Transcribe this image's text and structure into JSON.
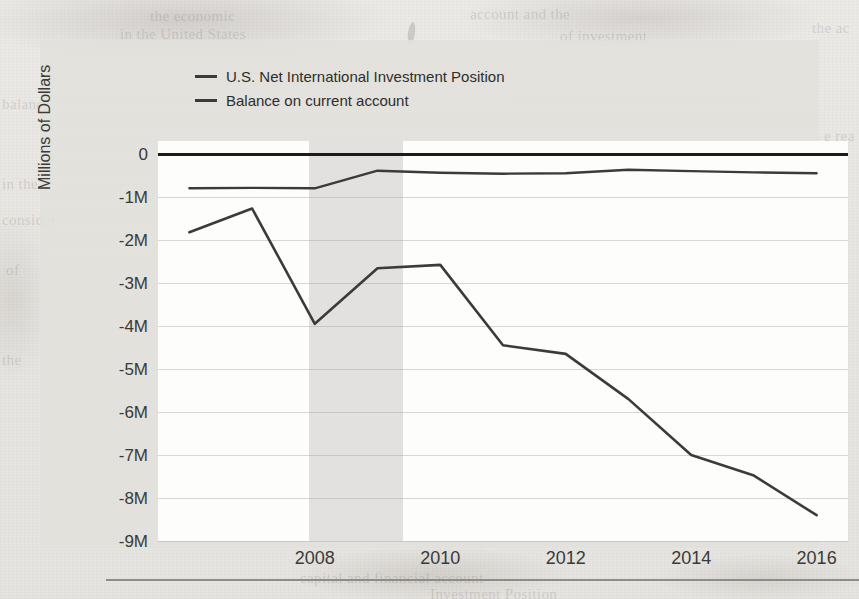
{
  "figure": {
    "kind": "scanned-book-figure",
    "y_axis_title": "Millions of Dollars",
    "legend": [
      {
        "label": "U.S. Net International Investment Position",
        "color": "#3b3b3b"
      },
      {
        "label": "Balance on current account",
        "color": "#3b3b3b"
      }
    ],
    "y_ticks": [
      "0",
      "-1M",
      "-2M",
      "-3M",
      "-4M",
      "-5M",
      "-6M",
      "-7M",
      "-8M",
      "-9M"
    ],
    "x_ticks": [
      "2008",
      "2010",
      "2012",
      "2014",
      "2016"
    ]
  },
  "page_ghost_text": [
    {
      "text": "the economic",
      "x": 150,
      "y": 8
    },
    {
      "text": "account and the",
      "x": 470,
      "y": 6
    },
    {
      "text": "in the United States",
      "x": 120,
      "y": 26
    },
    {
      "text": "of investment",
      "x": 560,
      "y": 28
    },
    {
      "text": "the ac",
      "x": 812,
      "y": 20
    },
    {
      "text": "balance",
      "x": 2,
      "y": 96
    },
    {
      "text": "in the",
      "x": 2,
      "y": 176
    },
    {
      "text": "consider",
      "x": 2,
      "y": 212
    },
    {
      "text": "of",
      "x": 6,
      "y": 262
    },
    {
      "text": "the",
      "x": 2,
      "y": 352
    },
    {
      "text": "e rea",
      "x": 824,
      "y": 128
    },
    {
      "text": "on",
      "x": 830,
      "y": 228
    },
    {
      "text": "cur",
      "x": 826,
      "y": 404
    },
    {
      "text": "an",
      "x": 832,
      "y": 452
    },
    {
      "text": "capital and financial account",
      "x": 300,
      "y": 570
    },
    {
      "text": "Investment Position",
      "x": 430,
      "y": 586
    }
  ],
  "chart_data": {
    "type": "line",
    "title": "",
    "xlabel": "",
    "ylabel": "Millions of Dollars",
    "xlim": [
      2005.5,
      2016.5
    ],
    "ylim": [
      -9000000,
      300000
    ],
    "y_tick_values": [
      0,
      -1000000,
      -2000000,
      -3000000,
      -4000000,
      -5000000,
      -6000000,
      -7000000,
      -8000000,
      -9000000
    ],
    "y_tick_labels": [
      "0",
      "-1M",
      "-2M",
      "-3M",
      "-4M",
      "-5M",
      "-6M",
      "-7M",
      "-8M",
      "-9M"
    ],
    "x_tick_values": [
      2008,
      2010,
      2012,
      2014,
      2016
    ],
    "x_tick_labels": [
      "2008",
      "2010",
      "2012",
      "2014",
      "2016"
    ],
    "grid": true,
    "legend_position": "top-left",
    "units": "Millions of Dollars",
    "zero_reference_line": 0,
    "shaded_regions": [
      {
        "label": "recession",
        "x_start": 2007.9,
        "x_end": 2009.4,
        "color": "#e2e1df"
      }
    ],
    "x": [
      2006,
      2007,
      2008,
      2009,
      2010,
      2011,
      2012,
      2013,
      2014,
      2015,
      2016
    ],
    "series": [
      {
        "name": "U.S. Net International Investment Position",
        "color": "#3b3b3b",
        "values": [
          -1820000,
          -1270000,
          -3950000,
          -2660000,
          -2580000,
          -4450000,
          -4650000,
          -5700000,
          -7000000,
          -7480000,
          -8400000
        ]
      },
      {
        "name": "Balance on current account",
        "color": "#3b3b3b",
        "values": [
          -800000,
          -790000,
          -800000,
          -390000,
          -440000,
          -460000,
          -450000,
          -370000,
          -400000,
          -430000,
          -450000
        ]
      }
    ]
  }
}
